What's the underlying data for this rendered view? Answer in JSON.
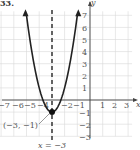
{
  "problem_label": "33.",
  "chart_data": {
    "type": "line",
    "title": "",
    "function": "y = 2(x + 3)^2 - 1",
    "xlabel": "x",
    "ylabel": "y",
    "xlim": [
      -7,
      3
    ],
    "ylim": [
      -3,
      7
    ],
    "x_ticks": [
      -7,
      -6,
      -5,
      -4,
      -2,
      -1,
      1,
      2,
      3
    ],
    "y_ticks": [
      -3,
      -2,
      -1,
      1,
      2,
      3,
      4,
      5,
      6,
      7
    ],
    "grid": true,
    "series": [
      {
        "name": "parabola",
        "x": [
          -5,
          -4.5,
          -4,
          -3.5,
          -3,
          -2.5,
          -2,
          -1.5,
          -1
        ],
        "y": [
          7,
          3.5,
          1,
          -0.5,
          -1,
          -0.5,
          1,
          3.5,
          7
        ]
      }
    ],
    "vertex": {
      "x": -3,
      "y": -1,
      "label": "(−3, −1)"
    },
    "axis_of_symmetry": {
      "x": -3,
      "label": "x = −3",
      "style": "dashed"
    }
  },
  "labels": {
    "x_axis": "x",
    "y_axis": "y",
    "vertex": "(−3, −1)",
    "axis_of_symmetry": "x = −3",
    "x_tick_labels": [
      "−7",
      "−6",
      "−5",
      "−4",
      "−2",
      "−1",
      "1",
      "2",
      "3"
    ],
    "y_tick_labels": [
      "7",
      "6",
      "5",
      "4",
      "3",
      "2",
      "1",
      "−1",
      "−2",
      "−3"
    ]
  }
}
